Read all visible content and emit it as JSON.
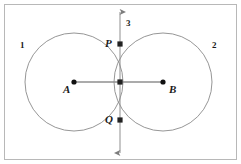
{
  "figure": {
    "frame": {
      "color": "#b8b8b8"
    },
    "colors": {
      "circle_stroke": "#8a8a8a",
      "segment": "#8f8f8f",
      "axis_line": "#8f8f8f",
      "point_fill": "#111111",
      "label_text": "#1a1a1a",
      "background": "#ffffff"
    },
    "labels": {
      "circle_one": "1",
      "circle_two": "2",
      "line_three": "3",
      "point_p": "P",
      "point_q": "Q",
      "center_a": "A",
      "center_b": "B"
    },
    "geometry": {
      "circle_one": {
        "cx": 74,
        "cy": 82,
        "r": 49
      },
      "circle_two": {
        "cx": 163,
        "cy": 82,
        "r": 49
      },
      "point_a": {
        "x": 74,
        "y": 82
      },
      "point_b": {
        "x": 163,
        "y": 82
      },
      "point_p": {
        "x": 120,
        "y": 44
      },
      "point_q": {
        "x": 120,
        "y": 120
      },
      "point_mid": {
        "x": 120,
        "y": 82
      },
      "axis_top": {
        "x": 120,
        "y": 10
      },
      "axis_bottom": {
        "x": 120,
        "y": 155
      }
    }
  }
}
